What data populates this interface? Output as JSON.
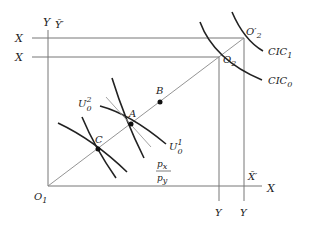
{
  "diagram": {
    "colors": {
      "axis": "#777777",
      "curve": "#222222",
      "text": "#222222"
    },
    "labels": {
      "y_left": "Y",
      "y_bar_prime": "Ȳ′",
      "x_top": "X",
      "x_second": "X",
      "o2_prime": "O′",
      "o2_prime_sub": "2",
      "o2": "O",
      "o2_sub": "2",
      "cic1": "CIC",
      "cic1_sub": "1",
      "cic0": "CIC",
      "cic0_sub": "0",
      "b": "B",
      "a": "A",
      "c": "C",
      "u02": "U",
      "u02_sup": "2",
      "u02_sub": "0",
      "u01": "U",
      "u01_sup": "1",
      "u01_sub": "0",
      "px": "p",
      "px_sub": "x",
      "py": "p",
      "py_sub": "y",
      "o1": "O",
      "o1_sub": "1",
      "x_bar_prime": "X̄′",
      "x_bottom": "X",
      "y_bottom_1": "Y",
      "y_bottom_2": "Y"
    },
    "points": [
      {
        "name": "C",
        "x": 98,
        "y": 149
      },
      {
        "name": "A",
        "x": 131,
        "y": 124
      },
      {
        "name": "B",
        "x": 160,
        "y": 102
      },
      {
        "name": "O1",
        "x": 48,
        "y": 186
      },
      {
        "name": "O2",
        "x": 219,
        "y": 57
      },
      {
        "name": "O2'",
        "x": 244,
        "y": 38
      }
    ]
  }
}
